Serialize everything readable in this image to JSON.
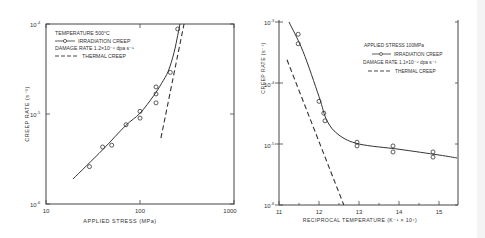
{
  "chart_data": [
    {
      "type": "line",
      "panel": "left",
      "title": "",
      "xlabel": "APPLIED STRESS (MPa)",
      "ylabel": "CREEP RATE (s⁻¹)",
      "xscale": "log",
      "yscale": "log",
      "xlim": [
        10,
        1000
      ],
      "ylim": [
        1e-06,
        0.0001
      ],
      "x_ticks": [
        "10",
        "100",
        "1000"
      ],
      "y_ticks": [
        "10⁻⁶",
        "10⁻⁵",
        "10⁻⁴"
      ],
      "grid": false,
      "legend_position": "upper left",
      "legend": {
        "title": "TEMPERATURE 500°C",
        "entries": [
          {
            "label": "IRRADIATION CREEP",
            "style": "solid-with-circles"
          },
          {
            "label": "DAMAGE RATE 1.2×10⁻⁶ dpa s⁻¹",
            "style": "text"
          },
          {
            "label": "THERMAL CREEP",
            "style": "dashed"
          }
        ]
      },
      "series": [
        {
          "name": "IRRADIATION CREEP (data)",
          "marker": "circle",
          "points": [
            [
              29,
              2.6e-06
            ],
            [
              40,
              4.3e-06
            ],
            [
              50,
              4.5e-06
            ],
            [
              71,
              7.6e-06
            ],
            [
              100,
              1.07e-05
            ],
            [
              100,
              9e-06
            ],
            [
              148,
              2e-05
            ],
            [
              148,
              1.67e-05
            ],
            [
              148,
              1.33e-05
            ],
            [
              210,
              2.9e-05
            ],
            [
              252,
              8.8e-05
            ]
          ]
        },
        {
          "name": "IRRADIATION CREEP (fit)",
          "line": "solid",
          "points": [
            [
              19.4,
              1.9e-06
            ],
            [
              40,
              4e-06
            ],
            [
              70,
              7.4e-06
            ],
            [
              100,
              1.02e-05
            ],
            [
              140,
              1.6e-05
            ],
            [
              170,
              2.2e-05
            ],
            [
              200,
              3e-05
            ],
            [
              230,
              4.8e-05
            ],
            [
              252,
              7.5e-05
            ],
            [
              266,
              0.0001
            ]
          ]
        },
        {
          "name": "THERMAL CREEP",
          "line": "dashed",
          "points": [
            [
              167,
              5.4e-06
            ],
            [
              294,
              0.0001
            ]
          ]
        }
      ]
    },
    {
      "type": "line",
      "panel": "right",
      "title": "",
      "xlabel": "RECIPROCAL TEMPERATURE (K⁻¹ × 10⁴)",
      "ylabel": "CREEP RATE (s⁻¹)",
      "xscale": "linear",
      "yscale": "log",
      "xlim": [
        11,
        15.45
      ],
      "ylim": [
        1e-06,
        0.001
      ],
      "x_ticks": [
        "11",
        "12",
        "13",
        "14",
        "15"
      ],
      "y_ticks": [
        "10⁻⁶",
        "10⁻⁵",
        "10⁻⁴",
        "10⁻³"
      ],
      "grid": false,
      "legend_position": "upper right",
      "legend": {
        "title": "APPLIED STRESS 100MPa",
        "entries": [
          {
            "label": "IRRADIATION CREEP",
            "style": "solid-with-circles"
          },
          {
            "label": "DAMAGE RATE 1.1×10⁻⁶ dpa s⁻¹",
            "style": "text"
          },
          {
            "label": "THERMAL CREEP",
            "style": "dashed"
          }
        ]
      },
      "series": [
        {
          "name": "IRRADIATION CREEP (data)",
          "marker": "circle",
          "points": [
            [
              11.48,
              0.00063
            ],
            [
              11.48,
              0.00044
            ],
            [
              12.0,
              5e-05
            ],
            [
              12.12,
              3.2e-05
            ],
            [
              12.15,
              2.4e-05
            ],
            [
              12.95,
              1.07e-05
            ],
            [
              12.95,
              9.3e-06
            ],
            [
              13.85,
              9.3e-06
            ],
            [
              13.85,
              7.4e-06
            ],
            [
              14.85,
              7.4e-06
            ],
            [
              14.85,
              6.1e-06
            ]
          ]
        },
        {
          "name": "IRRADIATION CREEP (fit)",
          "line": "solid",
          "points": [
            [
              11.25,
              0.001
            ],
            [
              11.6,
              0.00033
            ],
            [
              12.0,
              6e-05
            ],
            [
              12.2,
              2.4e-05
            ],
            [
              12.5,
              1.4e-05
            ],
            [
              13.0,
              1e-05
            ],
            [
              14.0,
              8.2e-06
            ],
            [
              15.0,
              6.6e-06
            ],
            [
              15.45,
              5.9e-06
            ]
          ]
        },
        {
          "name": "THERMAL CREEP",
          "line": "dashed",
          "points": [
            [
              11.2,
              0.00024
            ],
            [
              12.62,
              1e-06
            ]
          ]
        }
      ]
    }
  ],
  "left": {
    "ylabel": "CREEP RATE (s⁻¹)",
    "xlabel": "APPLIED STRESS (MPa)",
    "y_ticks": [
      {
        "base": "10",
        "exp": "-4"
      },
      {
        "base": "10",
        "exp": "-5"
      },
      {
        "base": "10",
        "exp": "-6"
      }
    ],
    "x_ticks": [
      "10",
      "100",
      "1000"
    ],
    "legend": {
      "line1": "TEMPERATURE 500°C",
      "line2": "IRRADIATION CREEP",
      "line3": "DAMAGE RATE 1.2×10⁻⁶ dpa s⁻¹",
      "line4": "THERMAL CREEP"
    }
  },
  "right": {
    "ylabel": "CREEP RATE (s⁻¹)",
    "xlabel": "RECIPROCAL TEMPERATURE (K⁻¹ × 10⁴)",
    "y_ticks": [
      {
        "base": "10",
        "exp": "-3"
      },
      {
        "base": "10",
        "exp": "-4"
      },
      {
        "base": "10",
        "exp": "-5"
      },
      {
        "base": "10",
        "exp": "-6"
      }
    ],
    "x_ticks": [
      "11",
      "12",
      "13",
      "14",
      "15"
    ],
    "legend": {
      "line1": "APPLIED STRESS 100MPa",
      "line2": "IRRADIATION CREEP",
      "line3": "DAMAGE RATE 1.1×10⁻⁶ dpa s⁻¹",
      "line4": "THERMAL CREEP"
    }
  },
  "colors": {
    "ink": "#333333",
    "axis": "#444444",
    "background": "#ffffff"
  }
}
